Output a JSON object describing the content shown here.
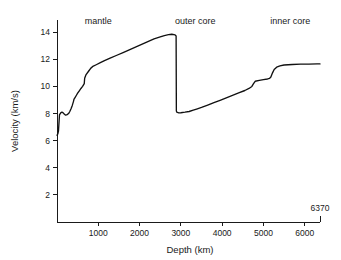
{
  "chart_data": {
    "type": "line",
    "title": "",
    "xlabel": "Depth (km)",
    "ylabel": "Velocity (km/s)",
    "xlim": [
      0,
      6370
    ],
    "ylim": [
      0,
      14.9
    ],
    "grid": false,
    "legend": null,
    "xticks": [
      1000,
      2000,
      3000,
      4000,
      5000,
      6000
    ],
    "xtick_labels": [
      "1000",
      "2000",
      "3000",
      "4000",
      "5000",
      "6000"
    ],
    "yticks": [
      2,
      4,
      6,
      8,
      10,
      12,
      14
    ],
    "ytick_labels": [
      "2",
      "4",
      "6",
      "8",
      "10",
      "12",
      "14"
    ],
    "endpoint_label": "6370",
    "endpoint_value": 6370,
    "line_color": "#111111",
    "annotations": [
      {
        "label": "mantle",
        "x": 1000,
        "y": 14.6
      },
      {
        "label": "outer core",
        "x": 3350,
        "y": 14.6
      },
      {
        "label": "inner core",
        "x": 5650,
        "y": 14.6
      }
    ],
    "series": [
      {
        "name": "P-wave velocity",
        "x": [
          0,
          20,
          35,
          60,
          90,
          120,
          150,
          180,
          210,
          245,
          280,
          310,
          340,
          370,
          400,
          410,
          440,
          470,
          500,
          540,
          580,
          620,
          660,
          670,
          700,
          760,
          820,
          880,
          950,
          1050,
          1150,
          1300,
          1450,
          1600,
          1750,
          1900,
          2050,
          2200,
          2350,
          2500,
          2600,
          2700,
          2780,
          2860,
          2885,
          2891,
          2900,
          2950,
          3000,
          3100,
          3200,
          3300,
          3400,
          3500,
          3650,
          3800,
          3950,
          4100,
          4250,
          4400,
          4550,
          4650,
          4720,
          4760,
          4800,
          4900,
          5000,
          5100,
          5150,
          5180,
          5220,
          5260,
          5320,
          5400,
          5500,
          5700,
          5900,
          6100,
          6300,
          6370
        ],
        "y": [
          6.4,
          6.5,
          6.7,
          7.9,
          8.05,
          8.1,
          8.05,
          7.95,
          7.88,
          7.92,
          8.0,
          8.15,
          8.35,
          8.6,
          8.9,
          9.05,
          9.2,
          9.35,
          9.5,
          9.68,
          9.85,
          10.0,
          10.2,
          10.6,
          10.85,
          11.1,
          11.35,
          11.5,
          11.6,
          11.75,
          11.9,
          12.1,
          12.3,
          12.5,
          12.7,
          12.9,
          13.1,
          13.3,
          13.5,
          13.65,
          13.75,
          13.82,
          13.85,
          13.8,
          13.72,
          8.2,
          8.1,
          8.05,
          8.06,
          8.1,
          8.15,
          8.25,
          8.35,
          8.45,
          8.62,
          8.8,
          8.98,
          9.16,
          9.34,
          9.52,
          9.7,
          9.85,
          10.0,
          10.2,
          10.38,
          10.44,
          10.5,
          10.55,
          10.6,
          10.7,
          11.0,
          11.25,
          11.42,
          11.52,
          11.58,
          11.62,
          11.64,
          11.65,
          11.66,
          11.66
        ]
      }
    ]
  }
}
